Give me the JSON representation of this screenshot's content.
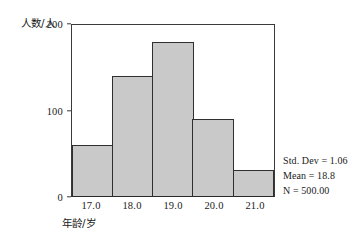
{
  "chart_data": {
    "type": "bar",
    "title": "",
    "xlabel": "年龄/岁",
    "ylabel": "人数/人",
    "categories": [
      "17.0",
      "18.0",
      "19.0",
      "20.0",
      "21.0"
    ],
    "values": [
      60,
      140,
      180,
      90,
      30
    ],
    "ylim": [
      0,
      200
    ],
    "y_ticks": [
      "0",
      "100",
      "200"
    ],
    "y_tick_values": [
      0,
      100,
      200
    ],
    "x_ticks": [
      "17.0",
      "18.0",
      "19.0",
      "20.0",
      "21.0"
    ],
    "grid": false,
    "legend": "none",
    "bar_fill_color": "#c9c9c9",
    "bar_edge_color": "#2f2f2f",
    "axis_color": "#3a3a3a",
    "annotations": [
      "Std. Dev = 1.06",
      "Mean = 18.8",
      "N = 500.00"
    ]
  },
  "stats": {
    "std_dev": "Std. Dev = 1.06",
    "mean": "Mean = 18.8",
    "n": "N = 500.00"
  }
}
